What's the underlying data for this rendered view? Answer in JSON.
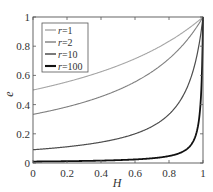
{
  "chart_data": {
    "type": "line",
    "title": "",
    "xlabel": "H",
    "ylabel": "e",
    "xlim": [
      0,
      1
    ],
    "ylim": [
      0,
      1
    ],
    "grid": false,
    "legend_position": "upper left",
    "x_ticks": [
      "0",
      "0.2",
      "0.4",
      "0.6",
      "0.8",
      "1"
    ],
    "y_ticks": [
      "0",
      "0.2",
      "0.4",
      "0.6",
      "0.8",
      "1"
    ],
    "x": [
      0,
      0.1,
      0.2,
      0.3,
      0.4,
      0.5,
      0.6,
      0.7,
      0.8,
      0.9,
      0.95,
      0.98,
      0.99,
      1.0
    ],
    "series": [
      {
        "name": "r=1",
        "r": 1,
        "color": "#a6a6a6",
        "width": 1.1,
        "values": [
          0.5,
          0.526,
          0.556,
          0.588,
          0.625,
          0.667,
          0.714,
          0.769,
          0.833,
          0.909,
          0.952,
          0.98,
          0.99,
          1.0
        ]
      },
      {
        "name": "r=2",
        "r": 2,
        "color": "#7f7f7f",
        "width": 1.1,
        "values": [
          0.333,
          0.357,
          0.385,
          0.417,
          0.455,
          0.5,
          0.556,
          0.625,
          0.714,
          0.833,
          0.909,
          0.962,
          0.98,
          1.0
        ]
      },
      {
        "name": "r=10",
        "r": 10,
        "color": "#4d4d4d",
        "width": 1.2,
        "values": [
          0.091,
          0.1,
          0.111,
          0.125,
          0.143,
          0.167,
          0.2,
          0.25,
          0.333,
          0.5,
          0.667,
          0.833,
          0.909,
          1.0
        ]
      },
      {
        "name": "r=100",
        "r": 100,
        "color": "#111111",
        "width": 1.8,
        "values": [
          0.0099,
          0.011,
          0.0123,
          0.0141,
          0.0164,
          0.0196,
          0.0244,
          0.0323,
          0.0476,
          0.0909,
          0.167,
          0.333,
          0.5,
          1.0
        ]
      }
    ],
    "annotations": []
  },
  "legend": {
    "items": [
      {
        "label": "r=1",
        "r_symbol": "r",
        "value": "=1"
      },
      {
        "label": "r=2",
        "r_symbol": "r",
        "value": "=2"
      },
      {
        "label": "r=10",
        "r_symbol": "r",
        "value": "=10"
      },
      {
        "label": "r=100",
        "r_symbol": "r",
        "value": "=100"
      }
    ]
  },
  "axes": {
    "x_label": "H",
    "y_label": "e"
  }
}
